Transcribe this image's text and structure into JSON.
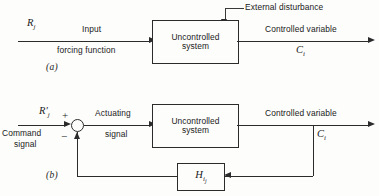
{
  "figure": {
    "background_color": "#fdfdfc",
    "line_color": "#2b2b2b"
  },
  "diagram_a": {
    "caption": "(a)",
    "input_symbol": "R",
    "input_subscript": "j",
    "input_label_top": "Input",
    "input_label_bottom": "forcing function",
    "disturbance_label": "External disturbance",
    "block_line1": "Uncontrolled",
    "block_line2": "system",
    "output_label": "Controlled variable",
    "output_symbol": "C",
    "output_subscript": "i"
  },
  "diagram_b": {
    "caption": "(b)",
    "input_symbol": "R",
    "input_prime": "′",
    "input_subscript": "j",
    "command_label_top": "Command",
    "command_label_bottom": "signal",
    "plus_sign": "+",
    "minus_sign": "−",
    "actuating_label_top": "Actuating",
    "actuating_label_bottom": "signal",
    "block_line1": "Uncontrolled",
    "block_line2": "system",
    "output_label": "Controlled variable",
    "output_symbol": "C",
    "output_subscript": "i",
    "feedback_symbol": "H",
    "feedback_subscript_outer": "i",
    "feedback_subscript_inner": "j"
  }
}
